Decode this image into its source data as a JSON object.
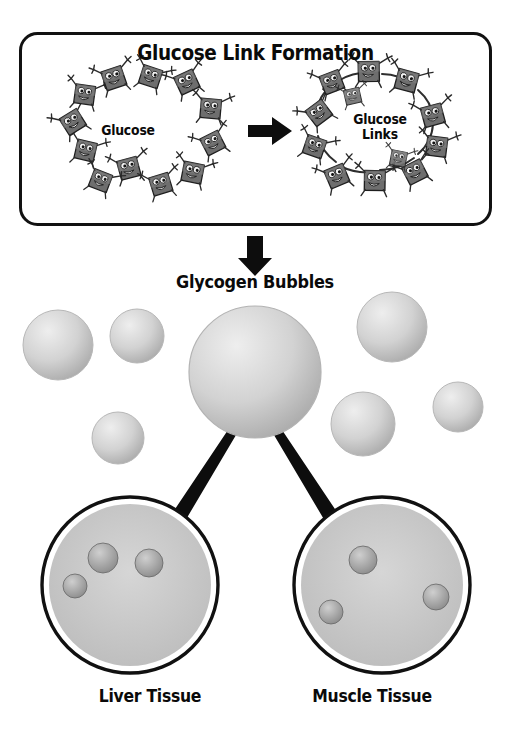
{
  "figure": {
    "kind": "educational-biology-diagram",
    "palette": {
      "ink": "#0a0a0a",
      "panel_border": "#111111",
      "background": "#ffffff",
      "glucose_body": "#6b6b6b",
      "glucose_body_dark": "#4a4a4a",
      "glucose_outline": "#1c1c1c",
      "bubble_fill": "#c9c9c9",
      "bubble_rim": "#e4e4e4",
      "arrow": "#0d0d0d",
      "circle_ring": "#111111",
      "liver_light": "#8e8e8e",
      "liver_dark": "#5a5a5a",
      "muscle_light": "#a8a8a8",
      "muscle_dark": "#5f5f5f"
    }
  },
  "panel": {
    "title": "Glucose Link Formation",
    "left_ring": {
      "label": "Glucose",
      "molecule_count": 12,
      "linked": false,
      "description": "Twelve cartoon glucose molecules arranged in a loose ring, unlinked"
    },
    "transform_arrow": {
      "icon": "arrow-right-icon",
      "direction": "right"
    },
    "right_ring": {
      "label": "Glucose\nLinks",
      "molecule_count": 12,
      "linked": true,
      "description": "Twelve cartoon glucose molecules joined hand-to-hand forming a chain ring"
    }
  },
  "flow_arrow": {
    "icon": "arrow-down-icon",
    "direction": "down"
  },
  "glycogen": {
    "heading": "Glycogen Bubbles",
    "main_bubble": {
      "name": "large-glycogen-bubble",
      "cx": 255,
      "cy": 372,
      "r": 66
    },
    "satellite_bubbles": [
      {
        "name": "glycogen-bubble-1",
        "cx": 58,
        "cy": 345,
        "r": 35
      },
      {
        "name": "glycogen-bubble-2",
        "cx": 137,
        "cy": 336,
        "r": 27
      },
      {
        "name": "glycogen-bubble-3",
        "cx": 118,
        "cy": 438,
        "r": 26
      },
      {
        "name": "glycogen-bubble-4",
        "cx": 392,
        "cy": 327,
        "r": 35
      },
      {
        "name": "glycogen-bubble-5",
        "cx": 363,
        "cy": 424,
        "r": 32
      },
      {
        "name": "glycogen-bubble-6",
        "cx": 458,
        "cy": 407,
        "r": 25
      }
    ],
    "total_bubble_count": 7
  },
  "branch_arrows": [
    {
      "name": "arrow-to-liver",
      "from": "large-glycogen-bubble",
      "to": "liver-tissue-circle"
    },
    {
      "name": "arrow-to-muscle",
      "from": "large-glycogen-bubble",
      "to": "muscle-tissue-circle"
    }
  ],
  "tissues": [
    {
      "name": "liver-tissue-circle",
      "label": "Liver Tissue",
      "cx": 130,
      "cy": 585,
      "r": 88,
      "deposit_count": 3,
      "deposits": [
        {
          "cx": 103,
          "cy": 558,
          "r": 15
        },
        {
          "cx": 149,
          "cy": 563,
          "r": 14
        },
        {
          "cx": 75,
          "cy": 586,
          "r": 12
        }
      ],
      "content_description": "Liver organ silhouette with glycogen granule deposits"
    },
    {
      "name": "muscle-tissue-circle",
      "label": "Muscle Tissue",
      "cx": 382,
      "cy": 585,
      "r": 88,
      "deposit_count": 3,
      "deposits": [
        {
          "cx": 363,
          "cy": 560,
          "r": 14
        },
        {
          "cx": 436,
          "cy": 597,
          "r": 13
        },
        {
          "cx": 331,
          "cy": 612,
          "r": 12
        }
      ],
      "content_description": "Interwoven skeletal muscle fibers with glycogen granule deposits"
    }
  ]
}
